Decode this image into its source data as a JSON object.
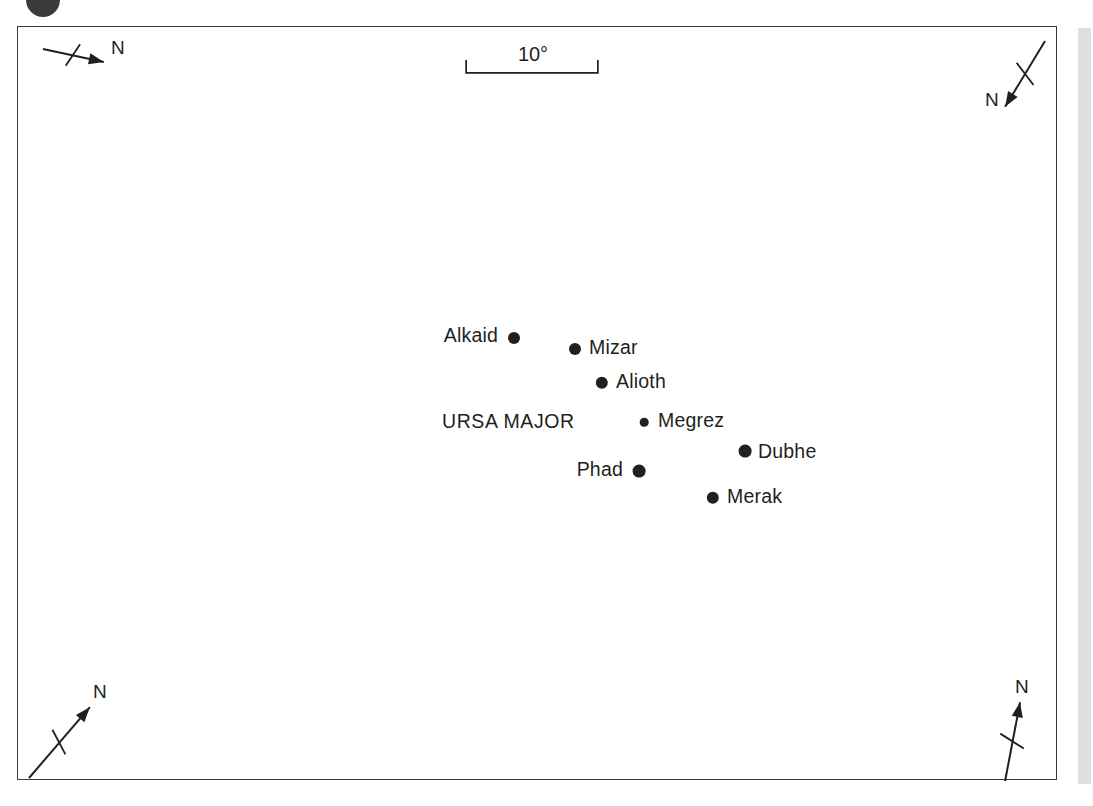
{
  "figure": {
    "type": "star-chart",
    "frame": {
      "x": 17,
      "y": 26,
      "width": 1040,
      "height": 754
    }
  },
  "scale_bar": {
    "label": "10°",
    "label_x": 532,
    "label_y": 56,
    "bar_left": 466,
    "bar_right": 598,
    "bar_y": 72,
    "tick_height": 12
  },
  "constellation": {
    "name": "URSA MAJOR",
    "label_x": 441,
    "label_y": 422
  },
  "stars": [
    {
      "name": "Alkaid",
      "dot_x": 513,
      "dot_y": 337,
      "radius": 6.0,
      "label_x": 497,
      "label_y": 336,
      "label_side": "left"
    },
    {
      "name": "Mizar",
      "dot_x": 574,
      "dot_y": 348,
      "radius": 6.0,
      "label_x": 588,
      "label_y": 348,
      "label_side": "right"
    },
    {
      "name": "Alioth",
      "dot_x": 601,
      "dot_y": 382,
      "radius": 6.2,
      "label_x": 615,
      "label_y": 382,
      "label_side": "right"
    },
    {
      "name": "Megrez",
      "dot_x": 643,
      "dot_y": 421,
      "radius": 4.3,
      "label_x": 657,
      "label_y": 421,
      "label_side": "right"
    },
    {
      "name": "Dubhe",
      "dot_x": 744,
      "dot_y": 450,
      "radius": 6.4,
      "label_x": 757,
      "label_y": 452,
      "label_side": "right"
    },
    {
      "name": "Phad",
      "dot_x": 638,
      "dot_y": 470,
      "radius": 6.4,
      "label_x": 622,
      "label_y": 470,
      "label_side": "left"
    },
    {
      "name": "Merak",
      "dot_x": 712,
      "dot_y": 497,
      "radius": 6.2,
      "label_x": 726,
      "label_y": 497,
      "label_side": "right"
    }
  ],
  "compasses": [
    {
      "id": "top-left",
      "label": "N",
      "tail_x": 42,
      "tail_y": 48,
      "head_x": 103,
      "head_y": 61,
      "cross_x": 72,
      "cross_y": 54,
      "cross_len": 13,
      "label_x": 110,
      "label_y": 49
    },
    {
      "id": "top-right",
      "label": "N",
      "tail_x": 1046,
      "tail_y": 40,
      "head_x": 1006,
      "head_y": 106,
      "cross_x": 1026,
      "cross_y": 73,
      "cross_len": 14,
      "label_x": 984,
      "label_y": 101
    },
    {
      "id": "bottom-left",
      "label": "N",
      "tail_x": 28,
      "tail_y": 779,
      "head_x": 89,
      "head_y": 708,
      "cross_x": 58,
      "cross_y": 743,
      "cross_len": 14,
      "label_x": 92,
      "label_y": 693
    },
    {
      "id": "bottom-right",
      "label": "N",
      "tail_x": 1006,
      "tail_y": 782,
      "head_x": 1021,
      "head_y": 703,
      "cross_x": 1013,
      "cross_y": 742,
      "cross_len": 14,
      "label_x": 1014,
      "label_y": 688
    }
  ],
  "colors": {
    "ink": "#231f20",
    "frame": "#3b3b3b",
    "background": "#ffffff",
    "margin_strip": "#d9d9d9"
  },
  "chart_data": {
    "type": "scatter",
    "title": "URSA MAJOR",
    "subtitle": "",
    "xlabel": "",
    "ylabel": "",
    "grid": false,
    "legend": "none",
    "scale_annotation": "10°",
    "point_labels": [
      "Alkaid",
      "Mizar",
      "Alioth",
      "Megrez",
      "Dubhe",
      "Phad",
      "Merak"
    ],
    "x": [
      513,
      574,
      601,
      643,
      744,
      638,
      712
    ],
    "y": [
      337,
      348,
      382,
      421,
      450,
      470,
      497
    ],
    "marker_sizes": [
      6.0,
      6.0,
      6.2,
      4.3,
      6.4,
      6.4,
      6.2
    ],
    "annotations": [
      "N",
      "N",
      "N",
      "N",
      "10°",
      "URSA MAJOR"
    ]
  }
}
